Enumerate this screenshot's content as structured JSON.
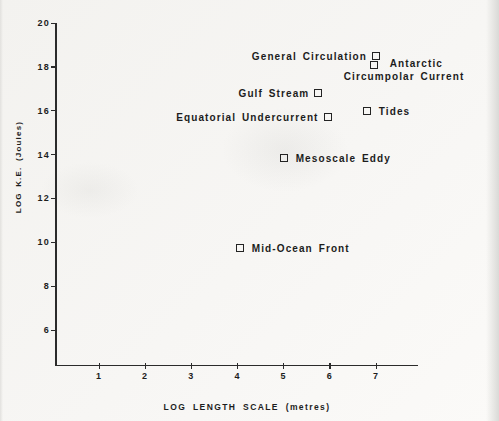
{
  "figure": {
    "background": "#f6f5f3",
    "ink": "#1d1d1d"
  },
  "chart_data": {
    "type": "scatter",
    "title": "",
    "xlabel": "LOG LENGTH SCALE (metres)",
    "ylabel": "LOG K.E. (Joules)",
    "xlim": [
      0,
      7.9
    ],
    "ylim": [
      4.4,
      20
    ],
    "x_ticks": [
      1,
      2,
      3,
      4,
      5,
      6,
      7
    ],
    "y_ticks": [
      20,
      18,
      16,
      14,
      12,
      10,
      8,
      6
    ],
    "grid": false,
    "legend": "none",
    "marker_style": "open-square",
    "points": [
      {
        "label": "General Circulation",
        "x": 7.0,
        "y": 18.5,
        "label_side": "left"
      },
      {
        "label": "Antarctic Circumpolar Current",
        "label_lines": [
          "Antarctic",
          "Circumpolar Current"
        ],
        "x": 6.95,
        "y": 18.1,
        "label_side": "right-wrap"
      },
      {
        "label": "Gulf Stream",
        "x": 5.75,
        "y": 16.8,
        "label_side": "left"
      },
      {
        "label": "Equatorial Undercurrent",
        "x": 5.95,
        "y": 15.7,
        "label_side": "left"
      },
      {
        "label": "Tides",
        "x": 6.8,
        "y": 16.0,
        "label_side": "right"
      },
      {
        "label": "Mesoscale Eddy",
        "x": 5.0,
        "y": 13.85,
        "label_side": "right"
      },
      {
        "label": "Mid-Ocean Front",
        "x": 4.05,
        "y": 9.75,
        "label_side": "right"
      }
    ]
  }
}
